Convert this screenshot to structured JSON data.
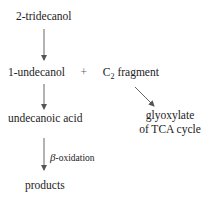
{
  "nodes": {
    "start": "2-tridecanol",
    "middle_left": "1-undecanol",
    "plus": "+",
    "fragment_prefix": "C",
    "fragment_sub": "2",
    "fragment_suffix": " fragment",
    "acid": "undecanoic acid",
    "glyoxylate_line1": "glyoxylate",
    "glyoxylate_line2": "of TCA cycle",
    "products": "products"
  },
  "edges": {
    "beta_symbol": "β",
    "beta_label": "-oxidation"
  }
}
